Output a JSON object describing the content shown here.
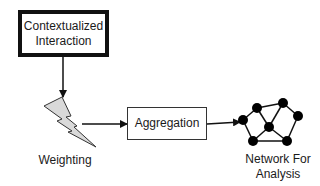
{
  "diagram": {
    "nodes": {
      "contextualized_interaction": {
        "line1": "Contextualized",
        "line2": "Interaction"
      },
      "weighting": {
        "label": "Weighting"
      },
      "aggregation": {
        "label": "Aggregation"
      },
      "network": {
        "line1": "Network For",
        "line2": "Analysis"
      }
    },
    "edges": [
      {
        "from": "Contextualized Interaction",
        "to": "Weighting"
      },
      {
        "from": "Weighting",
        "to": "Aggregation"
      },
      {
        "from": "Aggregation",
        "to": "Network For Analysis"
      }
    ],
    "colors": {
      "stroke": "#111111",
      "bolt_fill": "#d9d9d9",
      "node_fill": "#000000"
    }
  }
}
